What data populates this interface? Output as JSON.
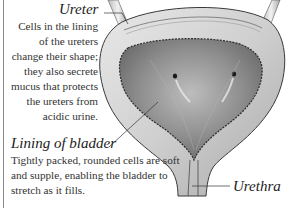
{
  "diagram": {
    "labels": {
      "ureter": {
        "title": "Ureter",
        "description": "Cells in the lining of the ureters change their shape; they also secrete mucus that protects the ureters from acidic urine."
      },
      "lining": {
        "title": "Lining of bladder",
        "description": "Tightly packed, rounded cells are soft and supple, enabling the bladder to stretch as it fills."
      },
      "urethra": {
        "title": "Urethra"
      }
    },
    "colors": {
      "background": "#ffffff",
      "wall_outer": "#d9d9d9",
      "wall_inner": "#bdbdbd",
      "lumen": "#8f8f8f",
      "outline": "#3a3a3a",
      "text": "#2b2b2b"
    }
  }
}
